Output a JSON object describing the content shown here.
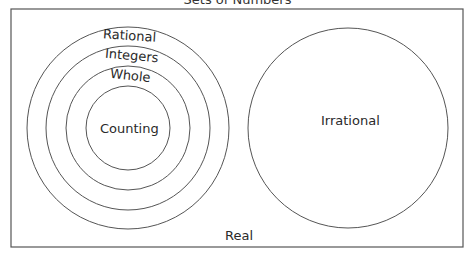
{
  "diagram": {
    "title": "Sets of Numbers",
    "universe_label": "Real",
    "nested_sets": [
      {
        "label": "Rational",
        "level": 1
      },
      {
        "label": "Integers",
        "level": 2
      },
      {
        "label": "Whole",
        "level": 3
      },
      {
        "label": "Counting",
        "level": 4
      }
    ],
    "separate_set": {
      "label": "Irrational"
    }
  },
  "colors": {
    "stroke": "#555555",
    "text": "#2a2a2a",
    "background": "#ffffff"
  }
}
